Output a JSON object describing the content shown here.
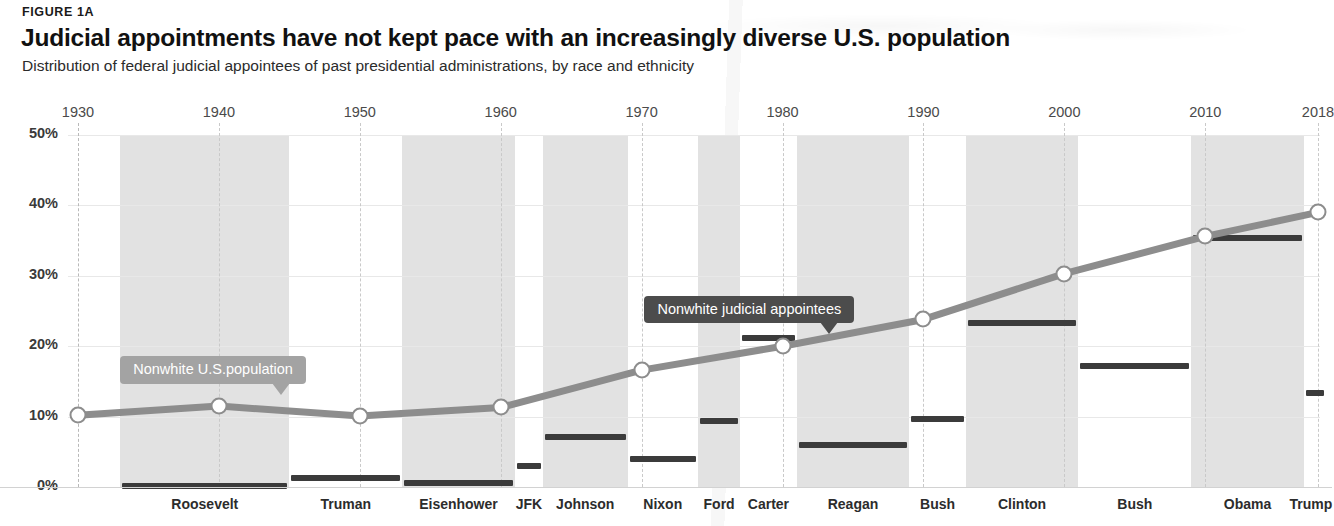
{
  "figure": {
    "eyebrow": "FIGURE 1A",
    "headline": "Judicial appointments have not kept pace with an increasingly diverse U.S. population",
    "subhead": "Distribution of federal judicial appointees of past presidential administrations, by race and ethnicity"
  },
  "colors": {
    "line": "#8d8d8d",
    "bar": "#3b3b3b",
    "band": "#e2e2e2",
    "callout_dark": "#4c4c4c",
    "callout_light": "#a3a3a3",
    "grid": "#e8e8e8",
    "text": "#231f20"
  },
  "annotations": {
    "appointees_label": "Nonwhite judicial appointees",
    "population_label": "Nonwhite U.S.population"
  },
  "chart_data": {
    "type": "line",
    "title": "Judicial appointments have not kept pace with an increasingly diverse U.S. population",
    "subtitle": "Distribution of federal judicial appointees of past presidential administrations, by race and ethnicity",
    "xlabel": "",
    "ylabel": "",
    "ylim": [
      0,
      50
    ],
    "xlim": [
      1930,
      2018
    ],
    "ytick_labels": [
      "0%",
      "10%",
      "20%",
      "30%",
      "40%",
      "50%"
    ],
    "ytick_values": [
      0,
      10,
      20,
      30,
      40,
      50
    ],
    "xtick_labels": [
      "1930",
      "1940",
      "1950",
      "1960",
      "1970",
      "1980",
      "1990",
      "2000",
      "2010",
      "2018"
    ],
    "xtick_values": [
      1930,
      1940,
      1950,
      1960,
      1970,
      1980,
      1990,
      2000,
      2010,
      2018
    ],
    "grid": true,
    "legend": "annotated-callouts",
    "series": [
      {
        "name": "Nonwhite U.S.population",
        "type": "line",
        "marker": "open-circle",
        "x": [
          1930,
          1940,
          1950,
          1960,
          1970,
          1980,
          1990,
          2000,
          2010,
          2018
        ],
        "values": [
          10.2,
          11.5,
          10.1,
          11.3,
          16.6,
          20.0,
          23.8,
          30.3,
          35.6,
          39.0
        ]
      },
      {
        "name": "Nonwhite judicial appointees",
        "type": "step-bars",
        "categories": [
          "Roosevelt",
          "Truman",
          "Eisenhower",
          "JFK",
          "Johnson",
          "Nixon",
          "Ford",
          "Carter",
          "Reagan",
          "Bush",
          "Clinton",
          "Bush",
          "Obama",
          "Trump"
        ],
        "values": [
          0.2,
          1.3,
          0.5,
          3.0,
          7.1,
          4.0,
          9.4,
          21.2,
          5.9,
          9.6,
          23.3,
          17.2,
          35.3,
          13.3
        ],
        "spans": [
          [
            1933,
            1945
          ],
          [
            1945,
            1953
          ],
          [
            1953,
            1961
          ],
          [
            1961,
            1963
          ],
          [
            1963,
            1969
          ],
          [
            1969,
            1974
          ],
          [
            1974,
            1977
          ],
          [
            1977,
            1981
          ],
          [
            1981,
            1989
          ],
          [
            1989,
            1993
          ],
          [
            1993,
            2001
          ],
          [
            2001,
            2009
          ],
          [
            2009,
            2017
          ],
          [
            2017,
            2018
          ]
        ]
      }
    ],
    "bands": [
      {
        "label": "Roosevelt",
        "from": 1933,
        "to": 1945,
        "shaded": true
      },
      {
        "label": "Truman",
        "from": 1945,
        "to": 1953,
        "shaded": false
      },
      {
        "label": "Eisenhower",
        "from": 1953,
        "to": 1961,
        "shaded": true
      },
      {
        "label": "JFK",
        "from": 1961,
        "to": 1963,
        "shaded": false
      },
      {
        "label": "Johnson",
        "from": 1963,
        "to": 1969,
        "shaded": true
      },
      {
        "label": "Nixon",
        "from": 1969,
        "to": 1974,
        "shaded": false
      },
      {
        "label": "Ford",
        "from": 1974,
        "to": 1977,
        "shaded": true
      },
      {
        "label": "Carter",
        "from": 1977,
        "to": 1981,
        "shaded": false
      },
      {
        "label": "Reagan",
        "from": 1981,
        "to": 1989,
        "shaded": true
      },
      {
        "label": "Bush",
        "from": 1989,
        "to": 1993,
        "shaded": false
      },
      {
        "label": "Clinton",
        "from": 1993,
        "to": 2001,
        "shaded": true
      },
      {
        "label": "Bush",
        "from": 2001,
        "to": 2009,
        "shaded": false
      },
      {
        "label": "Obama",
        "from": 2009,
        "to": 2017,
        "shaded": true
      },
      {
        "label": "Trump",
        "from": 2017,
        "to": 2018,
        "shaded": false
      }
    ]
  }
}
